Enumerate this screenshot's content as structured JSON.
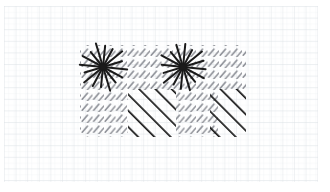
{
  "canvas": {
    "width": 330,
    "height": 192,
    "background_color": "#ffffff",
    "description": "Hand-drawn style hatching diagram on graph paper"
  },
  "paper": {
    "name": "graph-paper-background",
    "background_color": "#fefefe",
    "minor_grid_color": "#eceef1",
    "major_grid_color": "#dcdfe4",
    "minor_grid_spacing": 5.8,
    "major_grid_spacing": 11.6,
    "minor_line_width": 0.5,
    "major_line_width": 0.7,
    "origin_x": 4,
    "origin_y": 6,
    "margin_right": 12,
    "margin_bottom": 10
  },
  "diagram": {
    "name": "hatched-rectangle-diagram",
    "bounds": {
      "x": 80,
      "y": 45,
      "width": 166,
      "height": 92
    },
    "ink_color": "#1a1a1a",
    "light_ink_color": "#8d9097",
    "regions": [
      {
        "id": "region-top-left",
        "label": "light-hatch-top-left",
        "x": 80,
        "y": 45,
        "width": 86,
        "height": 46,
        "pattern": "short-dash-hatch",
        "weight": "light",
        "color": "#8d9097",
        "angle": 48,
        "dash_length": 6.5,
        "spacing_x": 11.5,
        "spacing_y": 11.0,
        "stroke_width": 1.5
      },
      {
        "id": "region-top-right",
        "label": "light-hatch-top-right",
        "x": 166,
        "y": 45,
        "width": 80,
        "height": 46,
        "pattern": "short-dash-hatch",
        "weight": "light",
        "color": "#8d9097",
        "angle": 48,
        "dash_length": 6.5,
        "spacing_x": 11.5,
        "spacing_y": 11.0,
        "stroke_width": 1.5
      },
      {
        "id": "region-bottom-left-light",
        "label": "light-hatch-bottom-left",
        "x": 80,
        "y": 91,
        "width": 48,
        "height": 46,
        "pattern": "short-dash-hatch",
        "weight": "light",
        "color": "#8d9097",
        "angle": 48,
        "dash_length": 6.5,
        "spacing_x": 11.5,
        "spacing_y": 11.0,
        "stroke_width": 1.5
      },
      {
        "id": "region-bottom-center-dark",
        "label": "dark-hatch-bottom-center",
        "x": 128,
        "y": 89,
        "width": 48,
        "height": 48,
        "pattern": "continuous-diagonal-hatch",
        "weight": "bold",
        "color": "#1a1a1a",
        "angle": 48,
        "spacing": 11.5,
        "stroke_width": 3.2
      },
      {
        "id": "region-bottom-center-light",
        "label": "light-hatch-bottom-center",
        "x": 176,
        "y": 91,
        "width": 42,
        "height": 46,
        "pattern": "short-dash-hatch",
        "weight": "light",
        "color": "#8d9097",
        "angle": 48,
        "dash_length": 6.5,
        "spacing_x": 11.5,
        "spacing_y": 11.0,
        "stroke_width": 1.5
      },
      {
        "id": "region-bottom-right-dark",
        "label": "dark-hatch-bottom-right",
        "x": 210,
        "y": 89,
        "width": 36,
        "height": 48,
        "pattern": "continuous-diagonal-hatch",
        "weight": "bold",
        "color": "#1a1a1a",
        "angle": 48,
        "spacing": 11.5,
        "stroke_width": 3.2
      }
    ],
    "starbursts": [
      {
        "id": "starburst-left",
        "label": "starburst-symbol-left",
        "center_x": 103,
        "center_y": 67,
        "radius": 22,
        "ray_count": 16,
        "color": "#1a1a1a",
        "stroke_width": 2.0
      },
      {
        "id": "starburst-right",
        "label": "starburst-symbol-right",
        "center_x": 183,
        "center_y": 67,
        "radius": 22,
        "ray_count": 16,
        "color": "#1a1a1a",
        "stroke_width": 2.0
      }
    ]
  }
}
